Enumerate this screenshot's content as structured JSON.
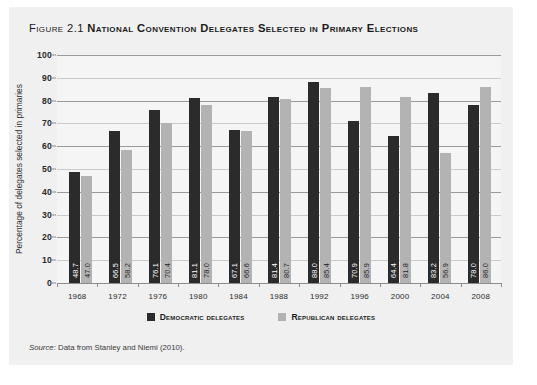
{
  "figure": {
    "number": "Figure 2.1",
    "title": "National Convention Delegates Selected in Primary Elections",
    "source_word": "Source:",
    "source_text": " Data from Stanley and Niemi (2010)."
  },
  "colors": {
    "democratic": "#2b2b2b",
    "republican": "#b3b3b3",
    "panel": "#f0f0f0",
    "plot": "#f5f5f5",
    "gridline": "#9a9a9a"
  },
  "legend": {
    "position": "bottom-center",
    "items": [
      {
        "label": "Democratic delegates",
        "color": "#2b2b2b"
      },
      {
        "label": "Republican delegates",
        "color": "#b3b3b3"
      }
    ]
  },
  "chart_data": {
    "type": "bar",
    "title": "National Convention Delegates Selected in Primary Elections",
    "xlabel": "",
    "ylabel": "Percentage of delegates selected in primaries",
    "ylim": [
      0,
      100
    ],
    "yticks": [
      0,
      10,
      20,
      30,
      40,
      50,
      60,
      70,
      80,
      90,
      100
    ],
    "ytick_labels": [
      "0",
      "10",
      "20",
      "30",
      "40",
      "50",
      "60",
      "70",
      "80",
      "90",
      "100"
    ],
    "grid": true,
    "categories": [
      "1968",
      "1972",
      "1976",
      "1980",
      "1984",
      "1988",
      "1992",
      "1996",
      "2000",
      "2004",
      "2008"
    ],
    "series": [
      {
        "name": "Democratic delegates",
        "color": "#2b2b2b",
        "values": [
          48.7,
          66.5,
          76.1,
          81.1,
          67.1,
          81.4,
          88.0,
          70.9,
          64.4,
          83.2,
          78.0
        ],
        "labels": [
          "48.7",
          "66.5",
          "76.1",
          "81.1",
          "67.1",
          "81.4",
          "88.0",
          "70.9",
          "64.4",
          "83.2",
          "78.0"
        ]
      },
      {
        "name": "Republican delegates",
        "color": "#b3b3b3",
        "values": [
          47.0,
          58.2,
          70.4,
          78.0,
          66.6,
          80.7,
          85.4,
          85.9,
          81.8,
          56.9,
          86.0
        ],
        "labels": [
          "47.0",
          "58.2",
          "70.4",
          "78.0",
          "66.6",
          "80.7",
          "85.4",
          "85.9",
          "81.8",
          "56.9",
          "86.0"
        ]
      }
    ]
  }
}
